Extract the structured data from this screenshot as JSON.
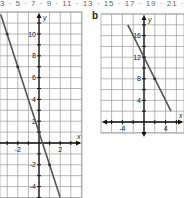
{
  "top_strip": {
    "text": "3 · 5 · 7 · 9 · 11 · 13 · 15 · 17 · 19 · 21 · 23 · 25"
  },
  "chart_data": [
    {
      "type": "line",
      "panel": "a",
      "title": "",
      "xlabel": "x",
      "ylabel": "y",
      "equation": "y = -3x + 1",
      "x_ticks": [
        -2,
        2
      ],
      "y_ticks": [
        -4,
        -2,
        2,
        4,
        6,
        8,
        10
      ],
      "x_tick_labels": [
        "-2",
        "2"
      ],
      "y_tick_labels": [
        "-4",
        "-2",
        "2",
        "4",
        "6",
        "8",
        "10"
      ],
      "xlim": [
        -3.7,
        3.7
      ],
      "ylim": [
        -5,
        12.5
      ],
      "grid": true,
      "grid_step": 1,
      "series": [
        {
          "name": "line",
          "x": [
            -3.6,
            2.0
          ],
          "y": [
            11.8,
            -5.0
          ]
        }
      ],
      "points": [
        {
          "x": -3,
          "y": 10
        },
        {
          "x": -2,
          "y": 7
        },
        {
          "x": 0,
          "y": 1
        },
        {
          "x": 1,
          "y": -2
        }
      ]
    },
    {
      "type": "line",
      "panel": "b",
      "title": "",
      "xlabel": "x",
      "ylabel": "y",
      "equation": "y = -2x + 12",
      "x_ticks": [
        -4,
        4
      ],
      "y_ticks": [
        4,
        8,
        12,
        16
      ],
      "x_tick_labels": [
        "-4",
        "4"
      ],
      "y_tick_labels": [
        "4",
        "8",
        "12",
        "16"
      ],
      "xlim": [
        -8,
        7.5
      ],
      "ylim": [
        -4,
        20
      ],
      "grid": true,
      "grid_step": 2,
      "series": [
        {
          "name": "line",
          "x": [
            -3.0,
            5.0
          ],
          "y": [
            18.0,
            2.0
          ]
        }
      ],
      "points": [
        {
          "x": 0,
          "y": 12
        },
        {
          "x": 2,
          "y": 8
        }
      ]
    }
  ],
  "panels": {
    "a": {
      "label": ""
    },
    "b": {
      "label": "b"
    }
  }
}
